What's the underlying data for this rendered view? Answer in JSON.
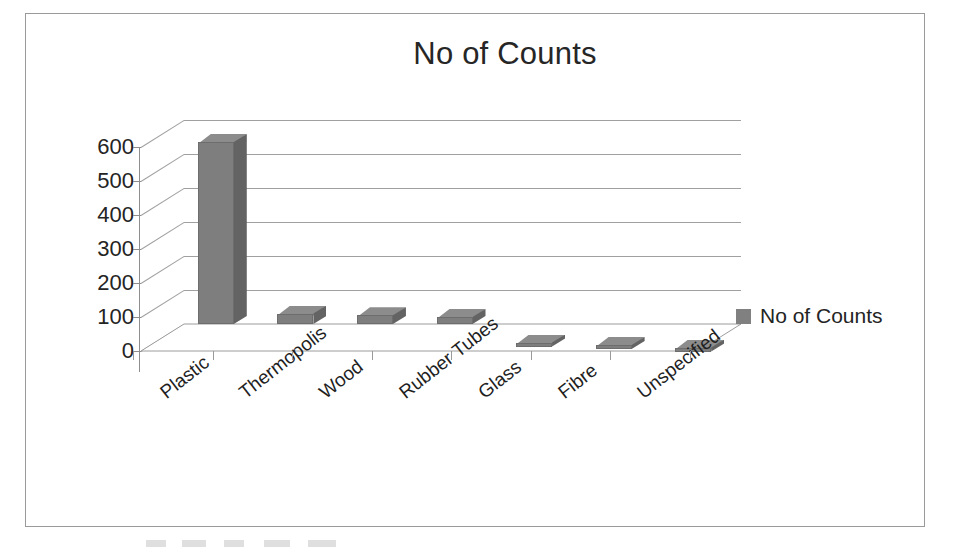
{
  "chart_data": {
    "type": "bar",
    "title": "No of Counts",
    "xlabel": "",
    "ylabel": "",
    "categories": [
      "Plastic",
      "Thermopolis",
      "Wood",
      "Rubber Tubes",
      "Glass",
      "Fibre",
      "Unspecified"
    ],
    "series": [
      {
        "name": "No of Counts",
        "values": [
          615,
          110,
          105,
          100,
          25,
          18,
          10
        ],
        "color": "#7e7e7e"
      }
    ],
    "values": [
      615,
      110,
      105,
      100,
      25,
      18,
      10
    ],
    "ylim": [
      0,
      600
    ],
    "y_ticks": [
      600,
      500,
      400,
      300,
      200,
      100,
      0
    ],
    "y_tick_labels": [
      "600",
      "500",
      "400",
      "300",
      "200",
      "100",
      "0"
    ],
    "grid": true,
    "three_d": true,
    "legend": {
      "position": "right",
      "entries": [
        {
          "label": "No of Counts",
          "color": "#808080"
        }
      ]
    }
  },
  "legend": {
    "label": "No of Counts"
  },
  "title": "No of Counts"
}
